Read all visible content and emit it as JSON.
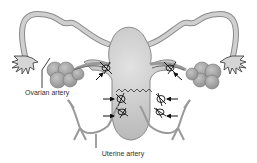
{
  "diagram": {
    "labels": {
      "ovarian_artery": "Ovarian artery",
      "uterine_artery": "Uterine artery"
    },
    "colors": {
      "organ_fill": "#c8c8c8",
      "organ_stroke": "#8a8a8a",
      "ovary_fill": "#a9a9a9",
      "line": "#222222",
      "background": "#ffffff"
    },
    "arrow_count": 6,
    "suture_count": 6
  }
}
